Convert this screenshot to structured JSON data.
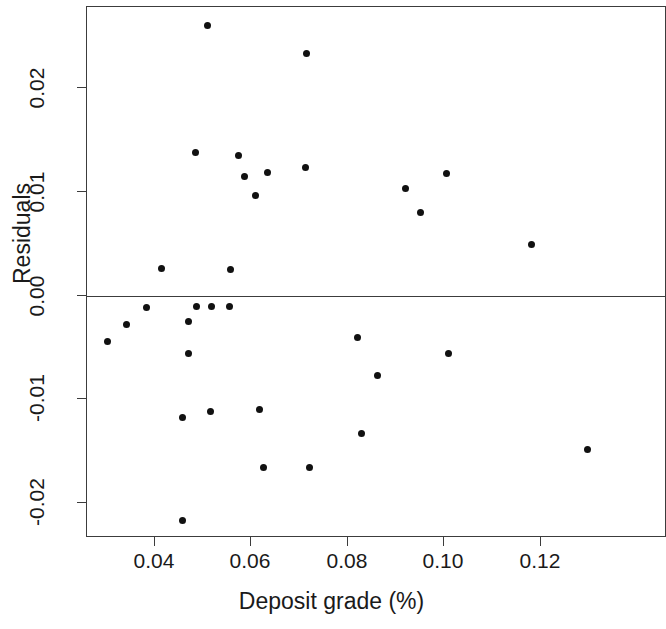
{
  "chart_data": {
    "type": "scatter",
    "title": "",
    "xlabel": "Deposit grade (%)",
    "ylabel": "Residuals",
    "xlim": [
      0.0255,
      0.134
    ],
    "ylim": [
      -0.0236,
      0.0285
    ],
    "xticks": [
      0.04,
      0.06,
      0.08,
      0.1,
      0.12
    ],
    "xtick_labels": [
      "0.04",
      "0.06",
      "0.08",
      "0.10",
      "0.12"
    ],
    "yticks": [
      0.02,
      0.01,
      0.0,
      -0.01,
      -0.02
    ],
    "ytick_labels": [
      "0.02",
      "0.01",
      "0.00",
      "-0.01",
      "-0.02"
    ],
    "grid": false,
    "legend": null,
    "reference_lines": [
      {
        "orientation": "horizontal",
        "value": 0.0,
        "color": "#3c3c3c"
      }
    ],
    "marker": {
      "shape": "circle",
      "filled": true,
      "color": "#111111",
      "size": 7
    },
    "n_points": 31,
    "x": [
      0.0508,
      0.0712,
      0.0486,
      0.0554,
      0.0626,
      0.0578,
      0.0602,
      0.0713,
      0.0923,
      0.1005,
      0.0947,
      0.118,
      0.0414,
      0.0553,
      0.0301,
      0.034,
      0.0381,
      0.0468,
      0.05,
      0.0531,
      0.0565,
      0.0468,
      0.0822,
      0.1008,
      0.0858,
      0.0457,
      0.0514,
      0.0605,
      0.0828,
      0.0625,
      0.0719,
      0.0457,
      0.1295
    ],
    "y": [
      0.026,
      0.0233,
      0.0138,
      0.0138,
      0.0122,
      0.0115,
      0.0098,
      0.0125,
      0.0099,
      0.012,
      0.0082,
      0.0049,
      0.0027,
      0.0025,
      -0.0044,
      -0.0028,
      -0.0012,
      -0.0021,
      -0.0011,
      -0.0011,
      -0.0011,
      -0.0056,
      -0.0038,
      -0.0056,
      -0.0075,
      -0.0118,
      -0.0106,
      -0.011,
      -0.0133,
      -0.0166,
      -0.0166,
      -0.0217,
      -0.0148
    ],
    "points": [
      {
        "x": 0.0508,
        "y": 0.026
      },
      {
        "x": 0.0713,
        "y": 0.0233
      },
      {
        "x": 0.0484,
        "y": 0.0138
      },
      {
        "x": 0.0573,
        "y": 0.0135
      },
      {
        "x": 0.0586,
        "y": 0.0115
      },
      {
        "x": 0.0633,
        "y": 0.0119
      },
      {
        "x": 0.0608,
        "y": 0.0096
      },
      {
        "x": 0.0712,
        "y": 0.0123
      },
      {
        "x": 0.0919,
        "y": 0.0103
      },
      {
        "x": 0.1004,
        "y": 0.0118
      },
      {
        "x": 0.095,
        "y": 0.008
      },
      {
        "x": 0.118,
        "y": 0.0049
      },
      {
        "x": 0.0414,
        "y": 0.0026
      },
      {
        "x": 0.0557,
        "y": 0.0025
      },
      {
        "x": 0.0301,
        "y": -0.0044
      },
      {
        "x": 0.0341,
        "y": -0.0028
      },
      {
        "x": 0.0382,
        "y": -0.0012
      },
      {
        "x": 0.0469,
        "y": -0.0025
      },
      {
        "x": 0.0485,
        "y": -0.0011
      },
      {
        "x": 0.0518,
        "y": -0.0011
      },
      {
        "x": 0.0555,
        "y": -0.0011
      },
      {
        "x": 0.0469,
        "y": -0.0056
      },
      {
        "x": 0.082,
        "y": -0.004
      },
      {
        "x": 0.1008,
        "y": -0.0056
      },
      {
        "x": 0.0861,
        "y": -0.0077
      },
      {
        "x": 0.0458,
        "y": -0.0118
      },
      {
        "x": 0.0514,
        "y": -0.0112
      },
      {
        "x": 0.0616,
        "y": -0.011
      },
      {
        "x": 0.0827,
        "y": -0.0133
      },
      {
        "x": 0.0625,
        "y": -0.0166
      },
      {
        "x": 0.072,
        "y": -0.0166
      },
      {
        "x": 0.0458,
        "y": -0.0217
      },
      {
        "x": 0.1297,
        "y": -0.0148
      }
    ]
  },
  "axes": {
    "y_title": "Residuals",
    "x_title": "Deposit grade (%)",
    "y_tick_labels": [
      "0.02",
      "0.01",
      "0.00",
      "-0.01",
      "-0.02"
    ],
    "x_tick_labels": [
      "0.04",
      "0.06",
      "0.08",
      "0.10",
      "0.12"
    ]
  }
}
